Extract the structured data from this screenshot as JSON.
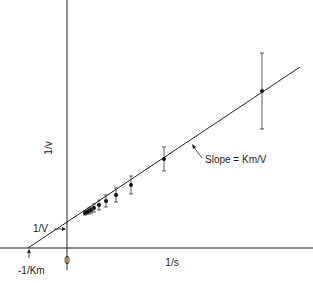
{
  "chart_data": {
    "type": "scatter",
    "xlabel": "1/s",
    "ylabel": "1/v",
    "x_origin_label": "0",
    "y_intercept_label": "1/V",
    "x_intercept_label": "-1/Km",
    "slope_label": "Slope = Km/V",
    "grid": false,
    "legend": "none",
    "series": [
      {
        "name": "data",
        "points_px": [
          {
            "x": 85,
            "y": 213,
            "err": 2
          },
          {
            "x": 87,
            "y": 212,
            "err": 2
          },
          {
            "x": 89,
            "y": 211,
            "err": 3
          },
          {
            "x": 91,
            "y": 210,
            "err": 3
          },
          {
            "x": 94,
            "y": 208,
            "err": 4
          },
          {
            "x": 99,
            "y": 205,
            "err": 5
          },
          {
            "x": 106,
            "y": 201,
            "err": 6
          },
          {
            "x": 116,
            "y": 195,
            "err": 7
          },
          {
            "x": 131,
            "y": 185,
            "err": 9
          },
          {
            "x": 164,
            "y": 159,
            "err": 12
          },
          {
            "x": 262,
            "y": 91,
            "err": 38
          }
        ]
      }
    ],
    "fit_line_px": {
      "x1": 28,
      "y1": 248,
      "x2": 300,
      "y2": 67
    },
    "axes_px": {
      "x_axis_y": 248,
      "y_axis_x": 67
    }
  }
}
